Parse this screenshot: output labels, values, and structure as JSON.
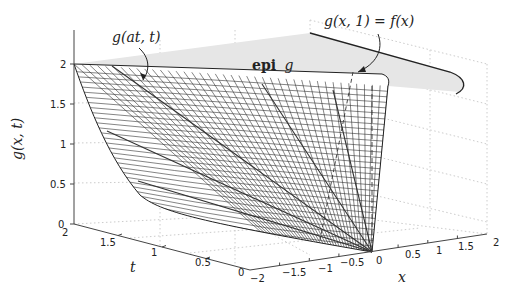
{
  "chart_data": {
    "type": "surface3d",
    "title": "",
    "zlabel": "g(x, t)",
    "ylabel": "t",
    "xlabel": "x",
    "z_ticks": [
      "0",
      "0.5",
      "1",
      "1.5",
      "2"
    ],
    "t_ticks": [
      "2",
      "1.5",
      "1",
      "0.5",
      "0"
    ],
    "x_ticks": [
      "−2",
      "−1.5",
      "−1",
      "−0.5",
      "0",
      "0.5",
      "1",
      "1.5",
      "2"
    ],
    "xlim": [
      -2,
      2
    ],
    "tlim": [
      0,
      2
    ],
    "zlim": [
      0,
      2
    ],
    "grid": true,
    "surface_description": "Perspective function g(x,t) = t f(x/t), mesh surface with shaded epigraph region above",
    "annotations": [
      {
        "text": "g(at, t)",
        "kind": "ray along line x = a t"
      },
      {
        "text": "g(x, 1) = f(x)",
        "kind": "curve slice at t = 1"
      },
      {
        "text": "epi g",
        "kind": "region label"
      }
    ]
  },
  "labels": {
    "zlabel": "g(x, t)",
    "tlabel": "t",
    "xlabel": "x",
    "annot_ray": "g(at, t)",
    "annot_slice": "g(x, 1) = f(x)",
    "epi_bold": "epi",
    "epi_it": "g"
  },
  "ticks": {
    "z": [
      "0",
      "0.5",
      "1",
      "1.5",
      "2"
    ],
    "t": [
      "2",
      "1.5",
      "1",
      "0.5",
      "0"
    ],
    "x": [
      "−2",
      "−1.5",
      "−1",
      "−0.5",
      "0",
      "0.5",
      "1",
      "1.5",
      "2"
    ]
  },
  "colors": {
    "mesh": "#333333",
    "epi_fill": "#e6e6e6",
    "grid": "#c8c8c8",
    "axis": "#444444"
  }
}
